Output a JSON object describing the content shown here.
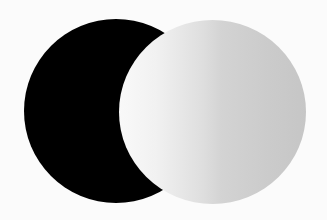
{
  "scene": {
    "background_color": "#fbfbfb",
    "shapes": [
      {
        "name": "dark-circle",
        "fill": "#000000"
      },
      {
        "name": "light-circle",
        "gradient": {
          "direction": "to right",
          "stops": [
            {
              "color": "#f9f9f9",
              "pos": "0%"
            },
            {
              "color": "#f1f1f1",
              "pos": "20%"
            },
            {
              "color": "#dedede",
              "pos": "45%"
            },
            {
              "color": "#d3d3d3",
              "pos": "55%"
            },
            {
              "color": "#cbcbcb",
              "pos": "80%"
            },
            {
              "color": "#c6c6c6",
              "pos": "100%"
            }
          ]
        }
      }
    ]
  }
}
